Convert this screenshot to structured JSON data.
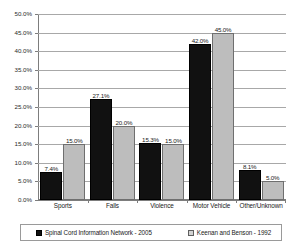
{
  "chart_data": {
    "type": "bar",
    "title": "",
    "subtitle": "",
    "xlabel": "",
    "ylabel": "",
    "ylim": [
      0,
      50
    ],
    "ytick_step": 5,
    "grid": true,
    "legend_position": "bottom",
    "value_suffix": "%",
    "categories": [
      "Sports",
      "Falls",
      "Violence",
      "Motor Vehicle",
      "Other/Unknown"
    ],
    "ytick_labels": [
      "50.0%",
      "45.0%",
      "40.0%",
      "35.0%",
      "30.0%",
      "25.0%",
      "20.0%",
      "15.0%",
      "10.0%",
      "5.0%",
      "0.0%"
    ],
    "ytick_values": [
      50,
      45,
      40,
      35,
      30,
      25,
      20,
      15,
      10,
      5,
      0
    ],
    "series": [
      {
        "name": "Spinal Cord Information Network - 2005",
        "color": "#111111",
        "values": [
          7.4,
          27.1,
          15.3,
          42.0,
          8.1
        ],
        "labels": [
          "7.4%",
          "27.1%",
          "15.3%",
          "42.0%",
          "8.1%"
        ]
      },
      {
        "name": "Keenan and Benson - 1992",
        "color": "#bdbdbd",
        "values": [
          15.0,
          20.0,
          15.0,
          45.0,
          5.0
        ],
        "labels": [
          "15.0%",
          "20.0%",
          "15.0%",
          "45.0%",
          "5.0%"
        ]
      }
    ]
  }
}
